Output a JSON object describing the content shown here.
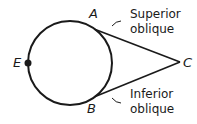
{
  "diagram": {
    "points": {
      "A": "A",
      "B": "B",
      "C": "C",
      "E": "E"
    },
    "labels": {
      "superior": [
        "Superior",
        "oblique"
      ],
      "inferior": [
        "Inferior",
        "oblique"
      ]
    },
    "colors": {
      "stroke": "#1a1a1a",
      "background": "#ffffff"
    }
  }
}
